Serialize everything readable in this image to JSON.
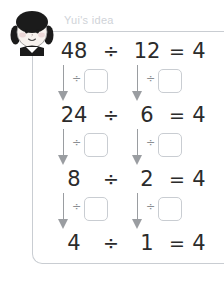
{
  "header": {
    "label": "Yui's idea",
    "avatar_icon": "girl-avatar-icon"
  },
  "colors": {
    "text": "#2b2b2b",
    "muted": "#cfd3d8",
    "rule": "#c9cdd2",
    "arrow": "#9a9da1"
  },
  "equations": [
    {
      "dividend": "48",
      "operator": "÷",
      "divisor": "12",
      "equals": "=",
      "result": "4"
    },
    {
      "dividend": "24",
      "operator": "÷",
      "divisor": "6",
      "equals": "=",
      "result": "4"
    },
    {
      "dividend": "8",
      "operator": "÷",
      "divisor": "2",
      "equals": "=",
      "result": "4"
    },
    {
      "dividend": "4",
      "operator": "÷",
      "divisor": "1",
      "equals": "=",
      "result": "4"
    }
  ],
  "connectors": [
    {
      "left_symbol": "÷",
      "left_value": "",
      "right_symbol": "÷",
      "right_value": ""
    },
    {
      "left_symbol": "÷",
      "left_value": "",
      "right_symbol": "÷",
      "right_value": ""
    },
    {
      "left_symbol": "÷",
      "left_value": "",
      "right_symbol": "÷",
      "right_value": ""
    }
  ]
}
